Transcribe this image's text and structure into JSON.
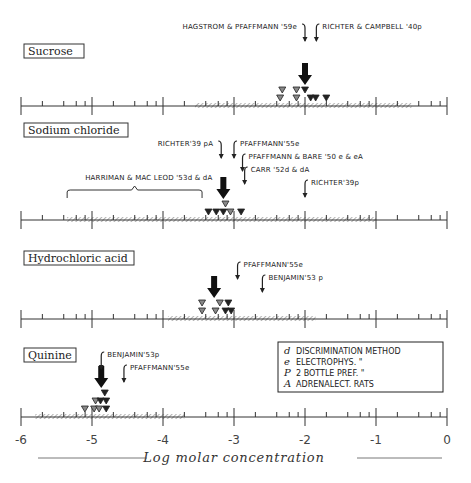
{
  "chart_data": {
    "type": "scatter",
    "title": "",
    "xlabel": "Log molar concentration",
    "ylabel": "",
    "xlim": [
      -6,
      0
    ],
    "xticks": [
      -6,
      -5,
      -4,
      -3,
      -2,
      -1,
      0
    ],
    "xtick_labels": [
      "-6",
      "-5",
      "-4",
      "-3",
      "-2",
      "-1",
      "0"
    ],
    "grid": false,
    "panels": [
      {
        "name": "Sucrose",
        "hatched_range": [
          -3.55,
          -0.5
        ],
        "median_arrow": -2.0,
        "triangles": [
          {
            "x": -2.32,
            "row": 2,
            "shade": "gray"
          },
          {
            "x": -2.12,
            "row": 2,
            "shade": "gray"
          },
          {
            "x": -2.0,
            "row": 2,
            "shade": "dark"
          },
          {
            "x": -2.35,
            "row": 1,
            "shade": "gray"
          },
          {
            "x": -2.12,
            "row": 1,
            "shade": "gray"
          },
          {
            "x": -1.92,
            "row": 1,
            "shade": "dark"
          },
          {
            "x": -1.85,
            "row": 1,
            "shade": "dark"
          },
          {
            "x": -1.7,
            "row": 1,
            "shade": "dark"
          }
        ],
        "references": [
          {
            "text": "HAGSTROM & PFAFFMANN '59e",
            "x": -2.0,
            "side": "left",
            "level": 0
          },
          {
            "text": "RICHTER & CAMPBELL '40p",
            "x": -1.84,
            "side": "right",
            "level": 0
          }
        ]
      },
      {
        "name": "Sodium chloride",
        "hatched_range": [
          -5.35,
          -1.0
        ],
        "median_arrow": -3.15,
        "bracket": {
          "from": -5.35,
          "to": -3.45,
          "label": "HARRIMAN & MAC LEOD '53d & dA"
        },
        "triangles": [
          {
            "x": -3.12,
            "row": 2,
            "shade": "gray"
          },
          {
            "x": -3.36,
            "row": 1,
            "shade": "dark"
          },
          {
            "x": -3.25,
            "row": 1,
            "shade": "dark"
          },
          {
            "x": -3.15,
            "row": 1,
            "shade": "dark"
          },
          {
            "x": -3.05,
            "row": 1,
            "shade": "gray"
          },
          {
            "x": -2.9,
            "row": 1,
            "shade": "dark"
          }
        ],
        "references": [
          {
            "text": "RICHTER'39 pA",
            "x": -3.18,
            "side": "left",
            "level": 0
          },
          {
            "text": "PFAFFMANN'55e",
            "x": -3.0,
            "side": "right",
            "level": 0
          },
          {
            "text": "PFAFFMANN & BARE '50 e & eA",
            "x": -2.88,
            "side": "right",
            "level": 1
          },
          {
            "text": "CARR '52d & dA",
            "x": -2.85,
            "side": "right",
            "level": 2
          },
          {
            "text": "RICHTER'39p",
            "x": -2.0,
            "side": "right",
            "level": 3
          }
        ]
      },
      {
        "name": "Hydrochloric acid",
        "hatched_range": [
          -3.93,
          -1.85
        ],
        "median_arrow": -3.28,
        "triangles": [
          {
            "x": -3.45,
            "row": 2,
            "shade": "gray"
          },
          {
            "x": -3.2,
            "row": 2,
            "shade": "gray"
          },
          {
            "x": -3.08,
            "row": 2,
            "shade": "dark"
          },
          {
            "x": -3.45,
            "row": 1,
            "shade": "gray"
          },
          {
            "x": -3.26,
            "row": 1,
            "shade": "gray"
          },
          {
            "x": -3.12,
            "row": 1,
            "shade": "dark"
          },
          {
            "x": -3.04,
            "row": 1,
            "shade": "dark"
          }
        ],
        "references": [
          {
            "text": "PFAFFMANN'55e",
            "x": -2.95,
            "side": "right",
            "level": 0
          },
          {
            "text": "BENJAMIN'53 p",
            "x": -2.6,
            "side": "right",
            "level": 1
          }
        ]
      },
      {
        "name": "Quinine",
        "hatched_range": [
          -5.8,
          -3.7
        ],
        "median_arrow": -4.87,
        "triangles": [
          {
            "x": -4.82,
            "row": 3,
            "shade": "dark"
          },
          {
            "x": -4.95,
            "row": 2,
            "shade": "gray"
          },
          {
            "x": -4.88,
            "row": 2,
            "shade": "dark"
          },
          {
            "x": -4.8,
            "row": 2,
            "shade": "dark"
          },
          {
            "x": -5.1,
            "row": 1,
            "shade": "gray"
          },
          {
            "x": -4.97,
            "row": 1,
            "shade": "gray"
          },
          {
            "x": -4.9,
            "row": 1,
            "shade": "gray"
          },
          {
            "x": -4.8,
            "row": 1,
            "shade": "dark"
          }
        ],
        "references": [
          {
            "text": "BENJAMIN'53p",
            "x": -4.87,
            "side": "right",
            "level": 0
          },
          {
            "text": "PFAFFMANN'55e",
            "x": -4.55,
            "side": "right",
            "level": 1
          }
        ]
      }
    ],
    "legend": {
      "placement": "right",
      "entries": [
        {
          "key": "d",
          "text": "DISCRIMINATION METHOD"
        },
        {
          "key": "e",
          "text": "ELECTROPHYS.    \""
        },
        {
          "key": "P",
          "text": "2 BOTTLE PREF.  \""
        },
        {
          "key": "A",
          "text": "ADRENALECT. RATS"
        }
      ]
    }
  }
}
